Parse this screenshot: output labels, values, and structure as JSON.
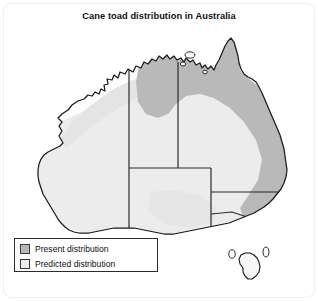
{
  "figure": {
    "title": "Cane toad distribution in Australia",
    "background_color": "#ffffff",
    "frame_color": "#f0f0f0"
  },
  "map": {
    "region": "Australia",
    "land_fill": "#fdfdfd",
    "coastline_color": "#1a1a1a",
    "state_border_color": "#2a2a2a",
    "present_color": "#b9b9b9",
    "predicted_color": "#ececec",
    "states": [
      "Western Australia",
      "Northern Territory",
      "South Australia",
      "Queensland",
      "New South Wales",
      "Victoria",
      "Tasmania"
    ],
    "present_distribution_regions": [
      "Top End (Northern Territory)",
      "Cape York Peninsula",
      "Eastern Queensland coast",
      "Northern New South Wales coast"
    ],
    "predicted_distribution_regions": [
      "Kimberley and Pilbara coast (Western Australia)",
      "Inland Western Australia",
      "Southern Western Australia",
      "South Australia coast",
      "Victoria",
      "Eastern New South Wales"
    ]
  },
  "legend": {
    "items": [
      {
        "label": "Present distribution",
        "color": "#b9b9b9"
      },
      {
        "label": "Predicted distribution",
        "color": "#ececec"
      }
    ]
  }
}
